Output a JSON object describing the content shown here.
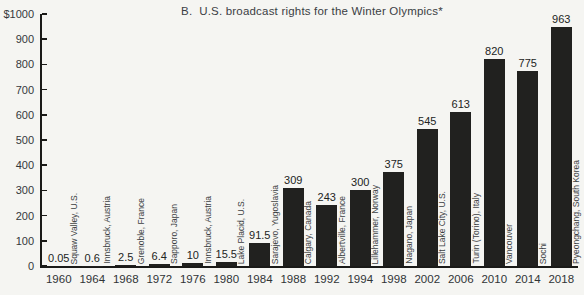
{
  "chart_data": {
    "type": "bar",
    "title": "B.  U.S. broadcast rights for the Winter Olympics*",
    "ylim": [
      0,
      1000
    ],
    "grid": false,
    "legend": "none",
    "bar_color": "#21211f",
    "background_color": "#f5f5f2",
    "y_tick_labels": [
      "$1000",
      "900",
      "800",
      "700",
      "600",
      "500",
      "400",
      "300",
      "200",
      "100",
      "0"
    ],
    "categories": [
      "1960",
      "1964",
      "1968",
      "1972",
      "1976",
      "1980",
      "1984",
      "1988",
      "1992",
      "1994",
      "1998",
      "2002",
      "2006",
      "2010",
      "2014",
      "2018"
    ],
    "values": [
      0.05,
      0.6,
      2.5,
      6.4,
      10,
      15.5,
      91.5,
      309,
      243,
      300,
      375,
      545,
      613,
      820,
      775,
      963
    ],
    "bars": [
      {
        "year": "1960",
        "value": 0.05,
        "label": "0.05",
        "city": "Squaw Valley, U.S."
      },
      {
        "year": "1964",
        "value": 0.6,
        "label": "0.6",
        "city": "Innsbruck, Austria"
      },
      {
        "year": "1968",
        "value": 2.5,
        "label": "2.5",
        "city": "Grenoble, France"
      },
      {
        "year": "1972",
        "value": 6.4,
        "label": "6.4",
        "city": "Sapporo, Japan"
      },
      {
        "year": "1976",
        "value": 10,
        "label": "10",
        "city": "Innsbruck, Austria"
      },
      {
        "year": "1980",
        "value": 15.5,
        "label": "15.5",
        "city": "Lake Placid, U.S."
      },
      {
        "year": "1984",
        "value": 91.5,
        "label": "91.5",
        "city": "Sarajevo, Yugoslavia"
      },
      {
        "year": "1988",
        "value": 309,
        "label": "309",
        "city": "Calgary, Canada"
      },
      {
        "year": "1992",
        "value": 243,
        "label": "243",
        "city": "Albertville, France"
      },
      {
        "year": "1994",
        "value": 300,
        "label": "300",
        "city": "Lillehammer, Norway"
      },
      {
        "year": "1998",
        "value": 375,
        "label": "375",
        "city": "Nagano, Japan"
      },
      {
        "year": "2002",
        "value": 545,
        "label": "545",
        "city": "Salt Lake City, U.S."
      },
      {
        "year": "2006",
        "value": 613,
        "label": "613",
        "city": "Turin (Torino), Italy"
      },
      {
        "year": "2010",
        "value": 820,
        "label": "820",
        "city": "Vancouver"
      },
      {
        "year": "2014",
        "value": 775,
        "label": "775",
        "city": "Sochi"
      },
      {
        "year": "2018",
        "value": 963,
        "label": "963",
        "city": "Pyeongchang, South Korea"
      }
    ]
  }
}
